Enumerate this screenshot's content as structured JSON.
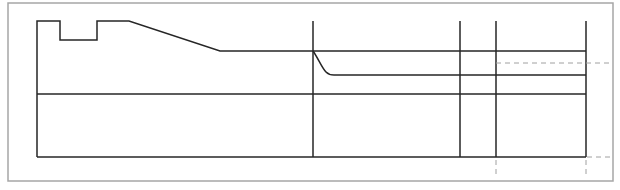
{
  "diagram": {
    "type": "technical-line-drawing",
    "colors": {
      "frame": "#a6a6a6",
      "line": "#262626",
      "dashed": "#a0a0a0",
      "background": "#ffffff"
    },
    "frame": {
      "x": 8,
      "y": 3,
      "width": 605,
      "height": 178
    },
    "top_profile_points": [
      [
        37,
        157
      ],
      [
        37,
        21
      ],
      [
        60,
        21
      ],
      [
        60,
        40
      ],
      [
        97,
        40
      ],
      [
        97,
        21
      ],
      [
        129,
        21
      ],
      [
        220,
        51
      ],
      [
        585,
        51
      ]
    ],
    "horizontal_lines": [
      {
        "name": "middle-layer",
        "y": 94,
        "x1": 37,
        "x2": 586
      },
      {
        "name": "bottom-edge",
        "y": 157,
        "x1": 37,
        "x2": 586
      },
      {
        "name": "inner-layer",
        "y": 75,
        "x1": 330,
        "x2": 586
      }
    ],
    "curve": {
      "from": [
        313,
        51
      ],
      "to": [
        330,
        75
      ]
    },
    "vertical_lines": [
      {
        "name": "divider-1",
        "x": 313,
        "y1": 21,
        "y2": 157
      },
      {
        "name": "divider-2",
        "x": 460,
        "y1": 21,
        "y2": 157
      },
      {
        "name": "divider-3",
        "x": 496,
        "y1": 21,
        "y2": 157
      },
      {
        "name": "divider-4",
        "x": 586,
        "y1": 21,
        "y2": 157
      }
    ],
    "dashed_lines": [
      {
        "name": "dashed-upper",
        "x1": 496,
        "y1": 63,
        "x2": 611,
        "y2": 63
      },
      {
        "name": "dashed-bottom-ext",
        "x1": 586,
        "y1": 157,
        "x2": 611,
        "y2": 157
      },
      {
        "name": "dashed-drop-1",
        "x1": 496,
        "y1": 160,
        "x2": 496,
        "y2": 177
      },
      {
        "name": "dashed-drop-2",
        "x1": 586,
        "y1": 160,
        "x2": 586,
        "y2": 177
      }
    ]
  }
}
